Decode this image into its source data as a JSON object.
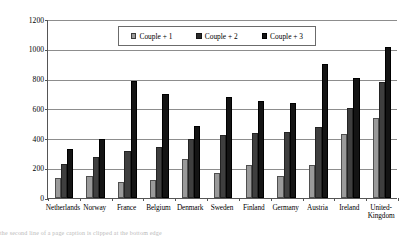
{
  "chart_data": {
    "type": "bar",
    "title": "",
    "subtitle": "",
    "xlabel": "",
    "ylabel": "",
    "ylim": [
      0,
      1200
    ],
    "ytick_labels": [
      "1200",
      "1000",
      "800",
      "600",
      "400",
      "200",
      "0"
    ],
    "ytick_values": [
      1200,
      1000,
      800,
      600,
      400,
      200,
      0
    ],
    "grid": true,
    "legend_position": "top-center",
    "categories": [
      "Netherlands",
      "Norway",
      "France",
      "Belgium",
      "Denmark",
      "Sweden",
      "Finland",
      "Germany",
      "Austria",
      "Ireland",
      "United-Kingdom"
    ],
    "series": [
      {
        "name": "Couple + 1",
        "color": "#9a9a9a",
        "values": [
          135,
          150,
          110,
          120,
          265,
          165,
          220,
          150,
          220,
          430,
          540
        ]
      },
      {
        "name": "Couple + 2",
        "color": "#3f3f3f",
        "values": [
          228,
          275,
          315,
          345,
          395,
          425,
          440,
          445,
          475,
          605,
          780
        ]
      },
      {
        "name": "Couple + 3",
        "color": "#141414",
        "values": [
          332,
          400,
          785,
          700,
          485,
          680,
          650,
          640,
          900,
          805,
          1015
        ]
      }
    ]
  },
  "legend": {
    "items": [
      {
        "label": "Couple + 1"
      },
      {
        "label": "Couple + 2"
      },
      {
        "label": "Couple + 3"
      }
    ]
  },
  "caption_sliver": {
    "text": "the second line of a page caption is clipped at the bottom edge"
  }
}
